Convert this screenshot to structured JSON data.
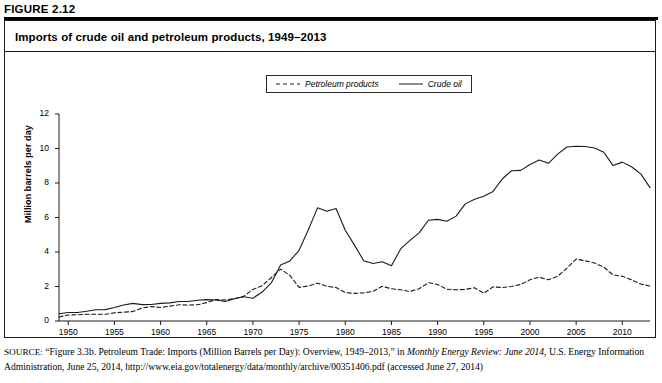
{
  "figure": {
    "number": "FIGURE 2.12",
    "title": "Imports of crude oil and petroleum products, 1949–2013"
  },
  "legend": {
    "position": "top-center",
    "entries": [
      {
        "label": "Petroleum products",
        "style": "dashed",
        "color": "#1a1a1a"
      },
      {
        "label": "Crude oil",
        "style": "solid",
        "color": "#1a1a1a"
      }
    ]
  },
  "source": {
    "prefix": "SOURCE:",
    "part1": " “Figure 3.3b. Petroleum Trade: Imports (Million Barrels per Day): Overview, 1949–2013,” in ",
    "italic1": "Monthly Energy Review: June 2014",
    "part2": ", U.S. Energy Information Administration, June 25, 2014, http://www.eia.gov/totalenergy/data/monthly/archive/00351406.pdf (accessed June 27, 2014)"
  },
  "chart_data": {
    "type": "line",
    "title": "Imports of crude oil and petroleum products, 1949–2013",
    "xlabel": "",
    "ylabel": "Million barrels per day",
    "xlim": [
      1949,
      2013
    ],
    "ylim": [
      0,
      12
    ],
    "yticks": [
      0,
      2,
      4,
      6,
      8,
      10,
      12
    ],
    "xticks": [
      1950,
      1955,
      1960,
      1965,
      1970,
      1975,
      1980,
      1985,
      1990,
      1995,
      2000,
      2005,
      2010
    ],
    "grid": false,
    "x": [
      1949,
      1950,
      1951,
      1952,
      1953,
      1954,
      1955,
      1956,
      1957,
      1958,
      1959,
      1960,
      1961,
      1962,
      1963,
      1964,
      1965,
      1966,
      1967,
      1968,
      1969,
      1970,
      1971,
      1972,
      1973,
      1974,
      1975,
      1976,
      1977,
      1978,
      1979,
      1980,
      1981,
      1982,
      1983,
      1984,
      1985,
      1986,
      1987,
      1988,
      1989,
      1990,
      1991,
      1992,
      1993,
      1994,
      1995,
      1996,
      1997,
      1998,
      1999,
      2000,
      2001,
      2002,
      2003,
      2004,
      2005,
      2006,
      2007,
      2008,
      2009,
      2010,
      2011,
      2012,
      2013
    ],
    "series": [
      {
        "name": "Crude oil",
        "style": "solid",
        "color": "#1a1a1a",
        "values": [
          0.42,
          0.49,
          0.49,
          0.57,
          0.65,
          0.66,
          0.78,
          0.93,
          1.02,
          0.95,
          0.96,
          1.02,
          1.05,
          1.13,
          1.13,
          1.2,
          1.24,
          1.22,
          1.13,
          1.29,
          1.41,
          1.32,
          1.68,
          2.22,
          3.24,
          3.48,
          4.1,
          5.29,
          6.56,
          6.36,
          6.52,
          5.26,
          4.4,
          3.49,
          3.33,
          3.43,
          3.2,
          4.18,
          4.67,
          5.11,
          5.84,
          5.89,
          5.78,
          6.08,
          6.79,
          7.06,
          7.23,
          7.51,
          8.23,
          8.71,
          8.73,
          9.07,
          9.33,
          9.14,
          9.67,
          10.09,
          10.13,
          10.12,
          10.03,
          9.78,
          9.01,
          9.21,
          8.94,
          8.53,
          7.73
        ]
      },
      {
        "name": "Petroleum products",
        "style": "dashed",
        "color": "#1a1a1a",
        "values": [
          0.23,
          0.35,
          0.36,
          0.39,
          0.39,
          0.39,
          0.47,
          0.51,
          0.55,
          0.75,
          0.84,
          0.78,
          0.86,
          0.94,
          0.93,
          0.94,
          1.07,
          1.24,
          1.22,
          1.3,
          1.43,
          1.83,
          2.05,
          2.52,
          3.01,
          2.64,
          1.95,
          2.03,
          2.19,
          2.01,
          1.94,
          1.65,
          1.6,
          1.63,
          1.72,
          2.01,
          1.87,
          1.81,
          1.71,
          1.87,
          2.22,
          2.12,
          1.84,
          1.81,
          1.83,
          1.93,
          1.61,
          1.98,
          1.94,
          2.0,
          2.12,
          2.39,
          2.54,
          2.39,
          2.6,
          3.06,
          3.59,
          3.49,
          3.36,
          3.12,
          2.67,
          2.59,
          2.39,
          2.14,
          2.03
        ]
      }
    ]
  }
}
